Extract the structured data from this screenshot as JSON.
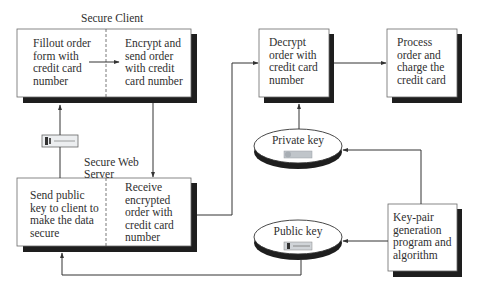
{
  "title_labels": {
    "secure_client": "Secure Client",
    "secure_web_server_line1": "Secure Web",
    "secure_web_server_line2": "Server"
  },
  "boxes": {
    "fillout_order": [
      "Fillout order",
      "form with",
      "credit card",
      "number"
    ],
    "encrypt_send": [
      "Encrypt and",
      "send order",
      "with credit",
      "card number"
    ],
    "send_public_key": [
      "Send public",
      "key to client to",
      "make the data",
      "secure"
    ],
    "receive_encrypted": [
      "Receive",
      "encrypted",
      "order with",
      "credit card",
      "number"
    ],
    "decrypt_order": [
      "Decrypt",
      "order with",
      "credit card",
      "number"
    ],
    "process_order": [
      "Process",
      "order and",
      "charge the",
      "credit card"
    ],
    "key_pair_generation": [
      "Key-pair",
      "generation",
      "program and",
      "algorithm"
    ]
  },
  "ellipses": {
    "private_key": "Private key",
    "public_key": "Public key"
  },
  "icons": {
    "public_key_in_transit": "key-icon",
    "private_key": "key-icon",
    "public_key": "key-icon"
  },
  "colors": {
    "line": "#3a3a3a",
    "shadow": "#1e1e1e",
    "box_fill": "#ffffff",
    "box_border": "#6a6a6a",
    "key_fill": "#c8cdd2"
  }
}
